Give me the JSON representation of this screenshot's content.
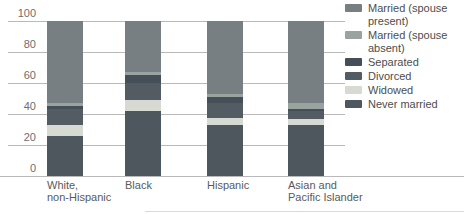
{
  "chart_data": {
    "type": "bar",
    "stacked": true,
    "orientation": "vertical",
    "title": "",
    "xlabel": "",
    "ylabel": "",
    "ylim": [
      0,
      100
    ],
    "yticks": [
      0,
      20,
      40,
      60,
      80,
      100
    ],
    "grid": true,
    "legend_position": "right",
    "categories": [
      {
        "lines": [
          "White,",
          "non-Hispanic"
        ]
      },
      {
        "lines": [
          "Black"
        ]
      },
      {
        "lines": [
          "Hispanic"
        ]
      },
      {
        "lines": [
          "Asian and",
          "Pacific Islander"
        ]
      }
    ],
    "series": [
      {
        "name": "Married (spouse present)",
        "color": "#787f83",
        "values": [
          53,
          33,
          47,
          53
        ]
      },
      {
        "name": "Married (spouse absent)",
        "color": "#9aa39f",
        "values": [
          2,
          2,
          2,
          3.5
        ]
      },
      {
        "name": "Separated",
        "color": "#454f57",
        "values": [
          1.5,
          5,
          4,
          1.5
        ]
      },
      {
        "name": "Divorced",
        "color": "#545c63",
        "values": [
          10.5,
          11,
          9.5,
          5
        ]
      },
      {
        "name": "Widowed",
        "color": "#d7dad3",
        "values": [
          7,
          7,
          4.5,
          4
        ]
      },
      {
        "name": "Never married",
        "color": "#4e565e",
        "values": [
          26,
          42,
          33,
          33
        ]
      }
    ]
  },
  "colors": {
    "background": "#ffffff",
    "gridline": "#b9b9b9",
    "axis_label": "#6e6e6e",
    "category_label": "#5a5a5a",
    "legend_text": "#4d4d4d"
  }
}
